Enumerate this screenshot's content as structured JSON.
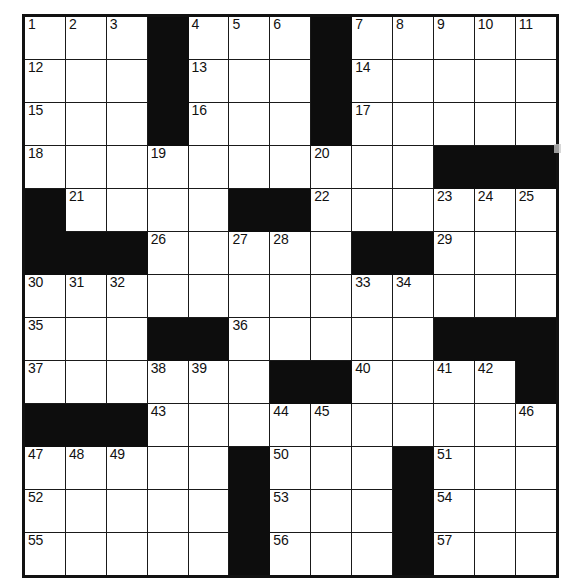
{
  "puzzle": {
    "type": "crossword-grid",
    "title": "Crossword Puzzle Grid",
    "columns": 13,
    "rows": 13,
    "colors": {
      "block": "#0d0d0d",
      "open": "#ffffff",
      "grid_line": "#1a1a1a",
      "number_text": "#111111"
    },
    "max_clue_number": 57,
    "legend": {
      "block_symbol": "#",
      "open_symbol": "."
    },
    "grid": [
      [
        ".",
        ".",
        ".",
        "#",
        ".",
        ".",
        ".",
        "#",
        ".",
        ".",
        ".",
        ".",
        "."
      ],
      [
        ".",
        ".",
        ".",
        "#",
        ".",
        ".",
        ".",
        "#",
        ".",
        ".",
        ".",
        ".",
        "."
      ],
      [
        ".",
        ".",
        ".",
        "#",
        ".",
        ".",
        ".",
        "#",
        ".",
        ".",
        ".",
        ".",
        "."
      ],
      [
        ".",
        ".",
        ".",
        ".",
        ".",
        ".",
        ".",
        ".",
        ".",
        ".",
        "#",
        "#",
        "#"
      ],
      [
        "#",
        ".",
        ".",
        ".",
        ".",
        "#",
        "#",
        ".",
        ".",
        ".",
        ".",
        ".",
        "."
      ],
      [
        "#",
        "#",
        "#",
        ".",
        ".",
        ".",
        ".",
        ".",
        "#",
        "#",
        ".",
        ".",
        "."
      ],
      [
        ".",
        ".",
        ".",
        ".",
        ".",
        ".",
        ".",
        ".",
        ".",
        ".",
        ".",
        ".",
        "."
      ],
      [
        ".",
        ".",
        ".",
        "#",
        "#",
        ".",
        ".",
        ".",
        ".",
        ".",
        "#",
        "#",
        "#"
      ],
      [
        ".",
        ".",
        ".",
        ".",
        ".",
        ".",
        "#",
        "#",
        ".",
        ".",
        ".",
        ".",
        "#"
      ],
      [
        "#",
        "#",
        "#",
        ".",
        ".",
        ".",
        ".",
        ".",
        ".",
        ".",
        ".",
        ".",
        "."
      ],
      [
        ".",
        ".",
        ".",
        ".",
        ".",
        "#",
        ".",
        ".",
        ".",
        "#",
        ".",
        ".",
        "."
      ],
      [
        ".",
        ".",
        ".",
        ".",
        ".",
        "#",
        ".",
        ".",
        ".",
        "#",
        ".",
        ".",
        "."
      ],
      [
        ".",
        ".",
        ".",
        ".",
        ".",
        "#",
        ".",
        ".",
        ".",
        "#",
        ".",
        ".",
        "."
      ]
    ],
    "numbers": [
      [
        1,
        2,
        3,
        null,
        4,
        5,
        6,
        null,
        7,
        8,
        9,
        10,
        11
      ],
      [
        12,
        null,
        null,
        null,
        13,
        null,
        null,
        null,
        14,
        null,
        null,
        null,
        null
      ],
      [
        15,
        null,
        null,
        null,
        16,
        null,
        null,
        null,
        17,
        null,
        null,
        null,
        null
      ],
      [
        18,
        null,
        null,
        19,
        null,
        null,
        null,
        20,
        null,
        null,
        null,
        null,
        null
      ],
      [
        null,
        21,
        null,
        null,
        null,
        null,
        null,
        22,
        null,
        null,
        23,
        24,
        25
      ],
      [
        null,
        null,
        null,
        26,
        null,
        27,
        28,
        null,
        null,
        null,
        29,
        null,
        null
      ],
      [
        30,
        31,
        32,
        null,
        null,
        null,
        null,
        null,
        33,
        34,
        null,
        null,
        null
      ],
      [
        35,
        null,
        null,
        null,
        null,
        36,
        null,
        null,
        null,
        null,
        null,
        null,
        null
      ],
      [
        37,
        null,
        null,
        38,
        39,
        null,
        null,
        null,
        40,
        null,
        41,
        42,
        null
      ],
      [
        null,
        null,
        null,
        43,
        null,
        null,
        44,
        45,
        null,
        null,
        null,
        null,
        46
      ],
      [
        47,
        48,
        49,
        null,
        null,
        null,
        50,
        null,
        null,
        null,
        51,
        null,
        null
      ],
      [
        52,
        null,
        null,
        null,
        null,
        null,
        53,
        null,
        null,
        null,
        54,
        null,
        null
      ],
      [
        55,
        null,
        null,
        null,
        null,
        null,
        56,
        null,
        null,
        null,
        57,
        null,
        null
      ]
    ]
  }
}
